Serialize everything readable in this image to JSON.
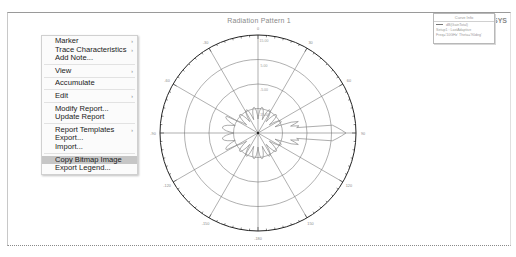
{
  "report": {
    "title": "Radiation Pattern 1",
    "brand_prefix": "Optimetrics",
    "brand": "ANSYS"
  },
  "legend": {
    "header": "Curve Info",
    "entries": [
      {
        "label": "dB(GainTotal)",
        "has_swatch": true
      },
      {
        "label": "Setup1 : LastAdaptive",
        "has_swatch": false
      },
      {
        "label": "Freq='10GHz' Theta='90deg'",
        "has_swatch": false
      }
    ]
  },
  "context_menu": {
    "groups": [
      [
        {
          "label": "Marker",
          "submenu": true
        },
        {
          "label": "Trace Characteristics",
          "submenu": true
        },
        {
          "label": "Add Note...",
          "submenu": false
        }
      ],
      [
        {
          "label": "View",
          "submenu": true
        }
      ],
      [
        {
          "label": "Accumulate",
          "submenu": false
        }
      ],
      [
        {
          "label": "Edit",
          "submenu": true
        }
      ],
      [
        {
          "label": "Modify Report...",
          "submenu": false
        },
        {
          "label": "Update Report",
          "submenu": false
        }
      ],
      [
        {
          "label": "Report Templates",
          "submenu": true
        },
        {
          "label": "Export...",
          "submenu": false
        },
        {
          "label": "Import...",
          "submenu": false
        }
      ],
      [
        {
          "label": "Copy Bitmap Image",
          "submenu": false,
          "highlighted": true
        },
        {
          "label": "Export Legend...",
          "submenu": false
        }
      ]
    ]
  },
  "chart_data": {
    "type": "polar",
    "title": "Radiation Pattern 1",
    "angle_labels": [
      "0",
      "30",
      "60",
      "90",
      "120",
      "150",
      "-180",
      "-150",
      "-120",
      "-90",
      "-60",
      "-30"
    ],
    "radial_labels": [
      "-15.00",
      "-5.00",
      "5.00",
      "15.00"
    ],
    "rings": 4,
    "series": [
      {
        "name": "dB(GainTotal)",
        "description": "main lobe toward 90 deg with side lobes"
      }
    ],
    "colors": {
      "grid": "#7a7a7a",
      "trace": "#8a8a8a",
      "outer": "#222222"
    }
  }
}
